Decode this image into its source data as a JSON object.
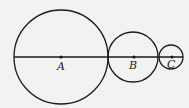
{
  "diagram": {
    "stroke_color": "#1a1a1a",
    "background": "#f2f2f0",
    "line": {
      "x1": 14,
      "y1": 57,
      "x2": 183,
      "y2": 57
    },
    "circles": [
      {
        "label": "A",
        "cx": 61,
        "cy": 57,
        "r": 47
      },
      {
        "label": "B",
        "cx": 133,
        "cy": 57,
        "r": 25
      },
      {
        "label": "C",
        "cx": 171,
        "cy": 57,
        "r": 12
      }
    ]
  }
}
